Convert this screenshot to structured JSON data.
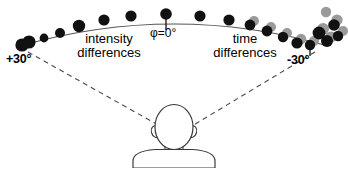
{
  "figure": {
    "background_color": "#ffffff",
    "width": 348,
    "height": 168,
    "dot_color_black": "#111111",
    "dot_color_gray": "#9a9a9a",
    "line_color": "#555555",
    "outline_color": "#3a3a3a"
  },
  "labels": {
    "left_angle": "+30°",
    "right_angle": "-30°",
    "center_angle": "φ=0°",
    "left_cue_line1": "intensity",
    "left_cue_line2": "differences",
    "right_cue_line1": "time",
    "right_cue_line2": "differences"
  },
  "icons": {
    "head_rear_view": "head-rear-icon",
    "left_ear": "ear-icon",
    "right_ear": "ear-icon",
    "center_tick": "tick-marker-icon",
    "right_tick": "tick-marker-icon",
    "left_sight_line": "dashed-sight-line-icon",
    "right_sight_line": "dashed-sight-line-icon"
  },
  "chart_data": {
    "type": "scatter",
    "title": "",
    "xlabel": "",
    "ylabel": "",
    "annotations": [
      "+30°",
      "φ=0°",
      "-30°",
      "intensity differences",
      "time differences"
    ],
    "azimuth_range_deg": [
      -30,
      30
    ],
    "arc_path": "M 20,46 Q 174,2 328,46",
    "series": [
      {
        "name": "speaker-positions-black",
        "color": "#111111",
        "points": [
          {
            "x": 22,
            "y": 45,
            "r": 6.6,
            "azimuth_deg": 30
          },
          {
            "x": 29,
            "y": 42,
            "r": 6.6,
            "azimuth_deg": 29
          },
          {
            "x": 44,
            "y": 38,
            "r": 4.4,
            "azimuth_deg": 27
          },
          {
            "x": 60,
            "y": 33,
            "r": 5.0,
            "azimuth_deg": 24
          },
          {
            "x": 79,
            "y": 26,
            "r": 6.2,
            "azimuth_deg": 20
          },
          {
            "x": 104,
            "y": 20,
            "r": 5.6,
            "azimuth_deg": 15
          },
          {
            "x": 131,
            "y": 16,
            "r": 5.6,
            "azimuth_deg": 10
          },
          {
            "x": 166,
            "y": 14,
            "r": 5.8,
            "azimuth_deg": 0
          },
          {
            "x": 200,
            "y": 16,
            "r": 5.6,
            "azimuth_deg": -8
          },
          {
            "x": 229,
            "y": 20,
            "r": 5.6,
            "azimuth_deg": -13
          },
          {
            "x": 250,
            "y": 25,
            "r": 5.4,
            "azimuth_deg": -17
          },
          {
            "x": 267,
            "y": 31,
            "r": 5.4,
            "azimuth_deg": -21
          },
          {
            "x": 283,
            "y": 37,
            "r": 5.2,
            "azimuth_deg": -24
          },
          {
            "x": 297,
            "y": 43,
            "r": 5.6,
            "azimuth_deg": -27
          },
          {
            "x": 310,
            "y": 45,
            "r": 5.2,
            "azimuth_deg": -28
          },
          {
            "x": 319,
            "y": 33,
            "r": 6.4,
            "azimuth_deg": -29
          },
          {
            "x": 327,
            "y": 41,
            "r": 6.0,
            "azimuth_deg": -30
          },
          {
            "x": 334,
            "y": 25,
            "r": 5.8,
            "azimuth_deg": -30
          },
          {
            "x": 338,
            "y": 36,
            "r": 5.2,
            "azimuth_deg": -30
          }
        ]
      },
      {
        "name": "speaker-positions-gray",
        "color": "#9a9a9a",
        "points": [
          {
            "x": 254,
            "y": 21,
            "r": 5.0
          },
          {
            "x": 271,
            "y": 27,
            "r": 5.0
          },
          {
            "x": 287,
            "y": 33,
            "r": 5.0
          },
          {
            "x": 301,
            "y": 39,
            "r": 5.2
          },
          {
            "x": 314,
            "y": 41,
            "r": 5.0
          },
          {
            "x": 323,
            "y": 29,
            "r": 6.0
          },
          {
            "x": 331,
            "y": 37,
            "r": 5.6
          },
          {
            "x": 337,
            "y": 20,
            "r": 5.6
          },
          {
            "x": 343,
            "y": 31,
            "r": 5.0
          },
          {
            "x": 326,
            "y": 12,
            "r": 5.2
          }
        ]
      }
    ],
    "grid": false,
    "legend": "none"
  }
}
